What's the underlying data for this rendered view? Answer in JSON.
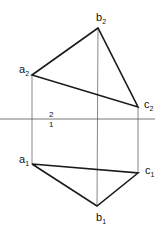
{
  "diagram": {
    "type": "orthographic-projection-triangle",
    "axis": {
      "x1": 0,
      "x2": 155,
      "y": 119,
      "upper_label": "2",
      "lower_label": "1",
      "label_x": 49
    },
    "frontal_projection": {
      "vertices": [
        {
          "id": "a2",
          "name": "a",
          "sub": "2",
          "x": 32,
          "y": 75,
          "lx": 19,
          "ly": 73
        },
        {
          "id": "b2",
          "name": "b",
          "sub": "2",
          "x": 98,
          "y": 28,
          "lx": 96,
          "ly": 21
        },
        {
          "id": "c2",
          "name": "c",
          "sub": "2",
          "x": 138,
          "y": 107,
          "lx": 144,
          "ly": 108
        }
      ]
    },
    "horizontal_projection": {
      "vertices": [
        {
          "id": "a1",
          "name": "a",
          "sub": "1",
          "x": 32,
          "y": 164,
          "lx": 19,
          "ly": 163
        },
        {
          "id": "b1",
          "name": "b",
          "sub": "1",
          "x": 97,
          "y": 206,
          "lx": 96,
          "ly": 221
        },
        {
          "id": "c1",
          "name": "c",
          "sub": "1",
          "x": 138,
          "y": 173,
          "lx": 145,
          "ly": 174
        }
      ]
    },
    "colors": {
      "line": "#1a1a1a",
      "thin_line": "#555555",
      "background": "#ffffff"
    }
  }
}
